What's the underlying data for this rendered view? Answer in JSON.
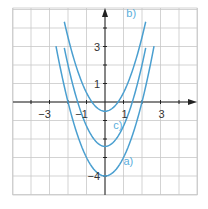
{
  "colors": {
    "grid": "#c8c8c8",
    "axis": "#222222",
    "curve": "#4a9fd0",
    "curve_label": "#5aaedc",
    "tick_text": "#333333"
  },
  "chart_data": {
    "type": "line",
    "title": "",
    "xlabel": "",
    "ylabel": "",
    "xlim": [
      -5,
      5
    ],
    "ylim": [
      -5,
      5
    ],
    "grid": true,
    "legend": "inline labels",
    "x_tick_labels": [
      {
        "value": -3,
        "label": "−3"
      },
      {
        "value": -1,
        "label": "−1"
      },
      {
        "value": 1,
        "label": "1"
      },
      {
        "value": 3,
        "label": "3"
      }
    ],
    "y_tick_labels": [
      {
        "value": 3,
        "label": "3"
      },
      {
        "value": 1,
        "label": "1"
      },
      {
        "value": -4,
        "label": "−4"
      }
    ],
    "series": [
      {
        "name": "a)",
        "formula": "y = x^2 - 4",
        "a": 1,
        "c": -4,
        "x_range": [
          -2.65,
          2.65
        ],
        "points": [
          [
            -2.65,
            3.0
          ],
          [
            -2,
            0
          ],
          [
            -1,
            -3
          ],
          [
            0,
            -4
          ],
          [
            1,
            -3
          ],
          [
            2,
            0
          ],
          [
            2.65,
            3.0
          ]
        ],
        "label_pos": [
          1.0,
          -3.4
        ]
      },
      {
        "name": "b)",
        "formula": "y = x^2 - 0.5",
        "a": 1,
        "c": -0.5,
        "x_range": [
          -2.2,
          2.2
        ],
        "points": [
          [
            -2.2,
            4.34
          ],
          [
            -1,
            0.5
          ],
          [
            0,
            -0.5
          ],
          [
            1,
            0.5
          ],
          [
            2.2,
            4.34
          ]
        ],
        "label_pos": [
          1.15,
          4.6
        ]
      },
      {
        "name": "c)",
        "formula": "y = x^2 - 2.25",
        "a": 1.1,
        "c": -2.4,
        "x_range": [
          -2.2,
          2.2
        ],
        "points": [
          [
            -2.2,
            2.92
          ],
          [
            -1.5,
            0
          ],
          [
            0,
            -2.4
          ],
          [
            1.5,
            0
          ],
          [
            2.2,
            2.92
          ]
        ],
        "label_pos": [
          0.45,
          -1.45
        ]
      }
    ]
  },
  "plot": {
    "left": 13,
    "top": 8,
    "right": 197,
    "bottom": 195,
    "origin_x": 105,
    "origin_y": 102,
    "unit": 18.5
  }
}
